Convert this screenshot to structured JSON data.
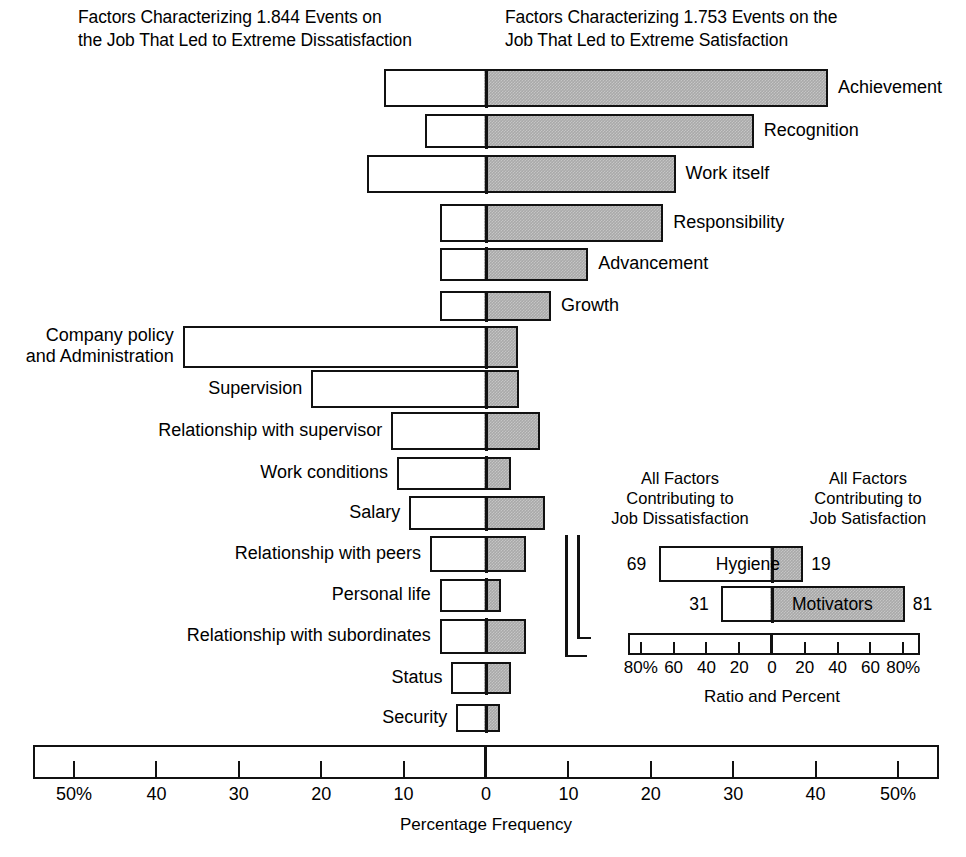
{
  "titles": {
    "left": "Factors Characterizing 1.844 Events on\nthe Job That Led to Extreme Dissatisfaction",
    "right": "Factors Characterizing 1.753 Events on the\nJob That Led to Extreme Satisfaction"
  },
  "axis": {
    "caption": "Percentage Frequency",
    "ticks": [
      "50%",
      "40",
      "30",
      "20",
      "10",
      "0",
      "10",
      "20",
      "30",
      "40",
      "50%"
    ],
    "tick_values": [
      -50,
      -40,
      -30,
      -20,
      -10,
      0,
      10,
      20,
      30,
      40,
      50
    ],
    "range": [
      -55,
      55
    ]
  },
  "inset": {
    "title_left": "All Factors\nContributing to\nJob Dissatisfaction",
    "title_right": "All Factors\nContributing to\nJob Satisfaction",
    "caption": "Ratio and Percent",
    "ticks": [
      "80%",
      "60",
      "40",
      "20",
      "0",
      "20",
      "40",
      "60",
      "80%"
    ],
    "tick_values": [
      -80,
      -60,
      -40,
      -20,
      0,
      20,
      40,
      60,
      80
    ],
    "range": [
      -90,
      90
    ],
    "bars": [
      {
        "label": "Hygiene",
        "neg": 69,
        "pos": 19,
        "neg_label": "69",
        "pos_label": "19"
      },
      {
        "label": "Motivators",
        "neg": 31,
        "pos": 81,
        "neg_label": "31",
        "pos_label": "81"
      }
    ]
  },
  "colors": {
    "satisfaction_fill": "#a9a9a9",
    "dissatisfaction_fill": "#ffffff",
    "outline": "#111111",
    "background": "#ffffff"
  },
  "chart_data": {
    "type": "bar",
    "xlabel": "Percentage Frequency",
    "ylabel": "",
    "xlim": [
      -55,
      55
    ],
    "grid": false,
    "legend": [
      "Dissatisfaction (white, left of 0)",
      "Satisfaction (gray, right of 0)"
    ],
    "categories": [
      "Achievement",
      "Recognition",
      "Work itself",
      "Responsibility",
      "Advancement",
      "Growth",
      "Company policy and Administration",
      "Supervision",
      "Relationship with supervisor",
      "Work conditions",
      "Salary",
      "Relationship with peers",
      "Personal life",
      "Relationship with subordinates",
      "Status",
      "Security"
    ],
    "series": [
      {
        "name": "Dissatisfaction",
        "values": [
          12.4,
          7.4,
          14.4,
          5.6,
          5.6,
          5.6,
          36.8,
          21.2,
          11.5,
          10.8,
          9.3,
          6.8,
          5.6,
          5.6,
          4.2,
          3.6
        ]
      },
      {
        "name": "Satisfaction",
        "values": [
          41.5,
          32.5,
          23.0,
          21.5,
          12.4,
          7.9,
          3.9,
          4.0,
          6.6,
          3.0,
          7.2,
          4.9,
          1.8,
          4.9,
          3.0,
          1.7
        ]
      }
    ],
    "bars": [
      {
        "label": "Achievement",
        "group": "motivator",
        "neg": 12.4,
        "pos": 41.5
      },
      {
        "label": "Recognition",
        "group": "motivator",
        "neg": 7.4,
        "pos": 32.5
      },
      {
        "label": "Work itself",
        "group": "motivator",
        "neg": 14.4,
        "pos": 23.0
      },
      {
        "label": "Responsibility",
        "group": "motivator",
        "neg": 5.6,
        "pos": 21.5
      },
      {
        "label": "Advancement",
        "group": "motivator",
        "neg": 5.6,
        "pos": 12.4
      },
      {
        "label": "Growth",
        "group": "motivator",
        "neg": 5.6,
        "pos": 7.9
      },
      {
        "label": "Company policy\nand Administration",
        "group": "hygiene",
        "neg": 36.8,
        "pos": 3.9
      },
      {
        "label": "Supervision",
        "group": "hygiene",
        "neg": 21.2,
        "pos": 4.0
      },
      {
        "label": "Relationship with supervisor",
        "group": "hygiene",
        "neg": 11.5,
        "pos": 6.6
      },
      {
        "label": "Work conditions",
        "group": "hygiene",
        "neg": 10.8,
        "pos": 3.0
      },
      {
        "label": "Salary",
        "group": "hygiene",
        "neg": 9.3,
        "pos": 7.2
      },
      {
        "label": "Relationship with peers",
        "group": "hygiene",
        "neg": 6.8,
        "pos": 4.9
      },
      {
        "label": "Personal life",
        "group": "hygiene",
        "neg": 5.6,
        "pos": 1.8
      },
      {
        "label": "Relationship with subordinates",
        "group": "hygiene",
        "neg": 5.6,
        "pos": 4.9
      },
      {
        "label": "Status",
        "group": "hygiene",
        "neg": 4.2,
        "pos": 3.0
      },
      {
        "label": "Security",
        "group": "hygiene",
        "neg": 3.6,
        "pos": 1.7
      }
    ],
    "inset": {
      "type": "bar",
      "title": "All Factors Contributing to Job Dissatisfaction / All Factors Contributing to Job Satisfaction",
      "xlabel": "Ratio and Percent",
      "xlim": [
        -90,
        90
      ],
      "categories": [
        "Hygiene",
        "Motivators"
      ],
      "series": [
        {
          "name": "Dissatisfaction",
          "values": [
            69,
            31
          ]
        },
        {
          "name": "Satisfaction",
          "values": [
            19,
            81
          ]
        }
      ]
    }
  }
}
